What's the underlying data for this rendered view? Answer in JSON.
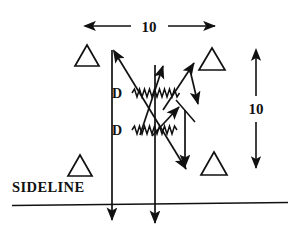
{
  "diagram": {
    "kind": "football-play-diagram",
    "title_text": "",
    "stroke_color": "#111111",
    "background_color": "#ffffff",
    "labels": {
      "width_dimension": "10",
      "height_dimension": "10",
      "defender_top": "D",
      "defender_bottom": "D",
      "sideline": "SIDELINE"
    },
    "markers": {
      "player_shape": "triangle-outline",
      "player_count": 4,
      "players": [
        {
          "name": "player-top-left",
          "x": 87,
          "y": 56
        },
        {
          "name": "player-top-right",
          "x": 212,
          "y": 60
        },
        {
          "name": "player-bottom-left",
          "x": 80,
          "y": 166
        },
        {
          "name": "player-bottom-right",
          "x": 214,
          "y": 164
        }
      ]
    },
    "dimensions": [
      {
        "name": "horizontal-10-yard",
        "value": "10",
        "orientation": "horizontal",
        "from_x": 85,
        "to_x": 215,
        "y": 26
      },
      {
        "name": "vertical-10-yard",
        "value": "10",
        "orientation": "vertical",
        "x": 256,
        "from_y": 50,
        "to_y": 168
      }
    ],
    "field_lines": [
      {
        "name": "sideline-boundary",
        "x1": 12,
        "y1": 205,
        "x2": 288,
        "y2": 203
      },
      {
        "name": "hash-line-left",
        "x1": 112,
        "y1": 50,
        "x2": 112,
        "y2": 222,
        "arrow": "end-down"
      },
      {
        "name": "hash-line-center",
        "x1": 155,
        "y1": 65,
        "x2": 155,
        "y2": 225,
        "arrow": "end-down"
      }
    ],
    "jam_lines": [
      {
        "name": "jam-squiggle-top",
        "x1": 132,
        "y1": 93,
        "x2": 181,
        "y2": 93
      },
      {
        "name": "jam-squiggle-bottom",
        "x1": 132,
        "y1": 130,
        "x2": 178,
        "y2": 130
      }
    ],
    "routes": [
      {
        "name": "route-long-diagonal",
        "description": "two-headed diagonal from upper-left to lower-right"
      },
      {
        "name": "route-center-up",
        "description": "up-right from bottom to arrowhead near center-top"
      },
      {
        "name": "route-out-break",
        "description": "up-right break toward top-right with arrowhead"
      },
      {
        "name": "route-down-stick",
        "description": "short down-right stem with arrowhead"
      },
      {
        "name": "route-in-cut",
        "description": "up-right cut with arrowhead at mid-field"
      },
      {
        "name": "route-vertical-drop",
        "description": "vertical line down with arrowhead"
      },
      {
        "name": "route-tail",
        "description": "short diagonal tail, no arrowhead"
      }
    ]
  }
}
